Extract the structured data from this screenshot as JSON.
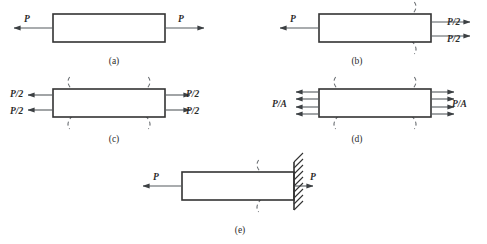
{
  "figure": {
    "background_color": "#ffffff",
    "bar_stroke_color": "#333333",
    "arrow_color": "#555a5e",
    "dashed_curve_color": "#6b6f73",
    "label_color": "#2b2b2b",
    "panels": [
      {
        "id": "a",
        "caption": "(a)",
        "caption_x": 114,
        "caption_y": 64,
        "bar": {
          "x": 53,
          "y": 14,
          "width": 112,
          "height": 28
        },
        "left_labels": [
          {
            "text": "P",
            "x": 24,
            "y": 22
          }
        ],
        "right_labels": [
          {
            "text": "P",
            "x": 178,
            "y": 22
          }
        ],
        "left_arrows": [
          {
            "tail_x": 53,
            "tip_x": 14,
            "y": 28
          }
        ],
        "right_arrows": [
          {
            "tail_x": 165,
            "tip_x": 204,
            "y": 28
          }
        ],
        "dashed_curves": []
      },
      {
        "id": "b",
        "caption": "(b)",
        "caption_x": 357,
        "caption_y": 64,
        "bar": {
          "x": 319,
          "y": 14,
          "width": 112,
          "height": 28
        },
        "left_labels": [
          {
            "text": "P",
            "x": 290,
            "y": 22
          }
        ],
        "right_labels": [
          {
            "text": "P/2",
            "x": 447,
            "y": 25
          },
          {
            "text": "P/2",
            "x": 447,
            "y": 42
          }
        ],
        "left_arrows": [
          {
            "tail_x": 319,
            "tip_x": 280,
            "y": 28
          }
        ],
        "right_arrows": [
          {
            "tail_x": 431,
            "tip_x": 470,
            "y": 22
          },
          {
            "tail_x": 431,
            "tip_x": 470,
            "y": 36
          }
        ],
        "dashed_curves": [
          {
            "side": "right",
            "center_x": 405
          }
        ]
      },
      {
        "id": "c",
        "caption": "(c)",
        "caption_x": 114,
        "caption_y": 142,
        "bar": {
          "x": 53,
          "y": 89,
          "width": 112,
          "height": 28
        },
        "left_labels": [
          {
            "text": "P/2",
            "x": 10,
            "y": 97
          },
          {
            "text": "P/2",
            "x": 10,
            "y": 114
          }
        ],
        "right_labels": [
          {
            "text": "P/2",
            "x": 186,
            "y": 97
          },
          {
            "text": "P/2",
            "x": 186,
            "y": 114
          }
        ],
        "left_arrows": [
          {
            "tail_x": 53,
            "tip_x": 28,
            "y": 95
          },
          {
            "tail_x": 53,
            "tip_x": 28,
            "y": 110
          }
        ],
        "right_arrows": [
          {
            "tail_x": 165,
            "tip_x": 190,
            "y": 95
          },
          {
            "tail_x": 165,
            "tip_x": 190,
            "y": 110
          }
        ],
        "dashed_curves": [
          {
            "side": "left",
            "center_x": 79
          },
          {
            "side": "right",
            "center_x": 139
          }
        ]
      },
      {
        "id": "d",
        "caption": "(d)",
        "caption_x": 357,
        "caption_y": 142,
        "bar": {
          "x": 319,
          "y": 89,
          "width": 112,
          "height": 28
        },
        "left_labels": [
          {
            "text": "P/A",
            "x": 272,
            "y": 107
          }
        ],
        "right_labels": [
          {
            "text": "P/A",
            "x": 452,
            "y": 107
          }
        ],
        "left_arrows": [
          {
            "tail_x": 319,
            "tip_x": 296,
            "y": 92
          },
          {
            "tail_x": 319,
            "tip_x": 296,
            "y": 99
          },
          {
            "tail_x": 319,
            "tip_x": 296,
            "y": 107
          },
          {
            "tail_x": 319,
            "tip_x": 296,
            "y": 114
          }
        ],
        "right_arrows": [
          {
            "tail_x": 431,
            "tip_x": 454,
            "y": 92
          },
          {
            "tail_x": 431,
            "tip_x": 454,
            "y": 99
          },
          {
            "tail_x": 431,
            "tip_x": 454,
            "y": 107
          },
          {
            "tail_x": 431,
            "tip_x": 454,
            "y": 114
          }
        ],
        "dashed_curves": [
          {
            "side": "left",
            "center_x": 345
          },
          {
            "side": "right",
            "center_x": 405
          }
        ]
      },
      {
        "id": "e",
        "caption": "(e)",
        "caption_x": 240,
        "caption_y": 233,
        "bar": {
          "x": 182,
          "y": 172,
          "width": 112,
          "height": 28
        },
        "left_labels": [
          {
            "text": "P",
            "x": 153,
            "y": 180
          }
        ],
        "right_labels": [
          {
            "text": "P",
            "x": 310,
            "y": 180
          }
        ],
        "left_arrows": [
          {
            "tail_x": 182,
            "tip_x": 143,
            "y": 186
          }
        ],
        "right_arrows": [
          {
            "tail_x": 294,
            "tip_x": 313,
            "y": 186
          }
        ],
        "dashed_curves": [
          {
            "side": "left",
            "center_x": 268
          }
        ],
        "wall": {
          "x": 294,
          "y": 162,
          "height": 48,
          "hatch_count": 9
        }
      }
    ]
  }
}
